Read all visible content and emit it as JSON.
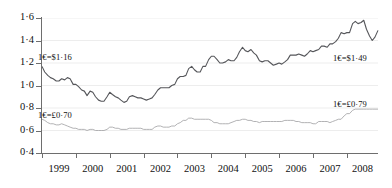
{
  "chart_data": {
    "type": "line",
    "title": "",
    "xlabel": "",
    "ylabel": "",
    "xlim": [
      1999.0,
      2008.92
    ],
    "ylim": [
      0.4,
      1.6
    ],
    "yticks": [
      "0·4",
      "0·6",
      "0·8",
      "1·0",
      "1·2",
      "1·4",
      "1·6"
    ],
    "ytick_values": [
      0.4,
      0.6,
      0.8,
      1.0,
      1.2,
      1.4,
      1.6
    ],
    "xticks": [
      "1999",
      "2000",
      "2001",
      "2002",
      "2003",
      "2004",
      "2005",
      "2006",
      "2007",
      "2008"
    ],
    "xtick_values": [
      1999,
      2000,
      2001,
      2002,
      2003,
      2004,
      2005,
      2006,
      2007,
      2008
    ],
    "grid": true,
    "legend": "none",
    "series": [
      {
        "name": "EUR/USD",
        "color": "#55565a",
        "x": [
          1999.0,
          1999.08,
          1999.17,
          1999.25,
          1999.33,
          1999.42,
          1999.5,
          1999.58,
          1999.67,
          1999.75,
          1999.83,
          1999.92,
          2000.0,
          2000.08,
          2000.17,
          2000.25,
          2000.33,
          2000.42,
          2000.5,
          2000.58,
          2000.67,
          2000.75,
          2000.83,
          2000.92,
          2001.0,
          2001.08,
          2001.17,
          2001.25,
          2001.33,
          2001.42,
          2001.5,
          2001.58,
          2001.67,
          2001.75,
          2001.83,
          2001.92,
          2002.0,
          2002.08,
          2002.17,
          2002.25,
          2002.33,
          2002.42,
          2002.5,
          2002.58,
          2002.67,
          2002.75,
          2002.83,
          2002.92,
          2003.0,
          2003.08,
          2003.17,
          2003.25,
          2003.33,
          2003.42,
          2003.5,
          2003.58,
          2003.67,
          2003.75,
          2003.83,
          2003.92,
          2004.0,
          2004.08,
          2004.17,
          2004.25,
          2004.33,
          2004.42,
          2004.5,
          2004.58,
          2004.67,
          2004.75,
          2004.83,
          2004.92,
          2005.0,
          2005.08,
          2005.17,
          2005.25,
          2005.33,
          2005.42,
          2005.5,
          2005.58,
          2005.67,
          2005.75,
          2005.83,
          2005.92,
          2006.0,
          2006.08,
          2006.17,
          2006.25,
          2006.33,
          2006.42,
          2006.5,
          2006.58,
          2006.67,
          2006.75,
          2006.83,
          2006.92,
          2007.0,
          2007.08,
          2007.17,
          2007.25,
          2007.33,
          2007.42,
          2007.5,
          2007.58,
          2007.67,
          2007.75,
          2007.83,
          2007.92,
          2008.0,
          2008.08,
          2008.17,
          2008.25,
          2008.33,
          2008.42,
          2008.5,
          2008.58,
          2008.67,
          2008.75,
          2008.83,
          2008.92
        ],
        "values": [
          1.17,
          1.12,
          1.09,
          1.07,
          1.06,
          1.04,
          1.04,
          1.06,
          1.05,
          1.07,
          1.06,
          1.01,
          1.01,
          0.99,
          0.96,
          0.95,
          0.91,
          0.95,
          0.94,
          0.9,
          0.87,
          0.86,
          0.86,
          0.9,
          0.94,
          0.92,
          0.9,
          0.89,
          0.87,
          0.85,
          0.86,
          0.9,
          0.91,
          0.9,
          0.89,
          0.89,
          0.88,
          0.87,
          0.88,
          0.89,
          0.92,
          0.96,
          0.98,
          0.98,
          0.98,
          0.98,
          1.0,
          1.01,
          1.06,
          1.08,
          1.08,
          1.09,
          1.15,
          1.17,
          1.14,
          1.12,
          1.12,
          1.17,
          1.17,
          1.23,
          1.26,
          1.26,
          1.23,
          1.2,
          1.2,
          1.21,
          1.23,
          1.22,
          1.22,
          1.25,
          1.3,
          1.34,
          1.31,
          1.3,
          1.32,
          1.29,
          1.27,
          1.22,
          1.21,
          1.22,
          1.22,
          1.2,
          1.18,
          1.19,
          1.2,
          1.19,
          1.21,
          1.23,
          1.27,
          1.27,
          1.27,
          1.28,
          1.27,
          1.26,
          1.28,
          1.31,
          1.3,
          1.31,
          1.32,
          1.35,
          1.35,
          1.34,
          1.37,
          1.37,
          1.39,
          1.42,
          1.47,
          1.46,
          1.47,
          1.47,
          1.55,
          1.57,
          1.55,
          1.56,
          1.58,
          1.5,
          1.44,
          1.4,
          1.43,
          1.49
        ],
        "start_label": "1€=$1·16",
        "end_label": "1€=$1·49"
      },
      {
        "name": "EUR/GBP",
        "color": "#a9a9ac",
        "x": [
          1999.0,
          1999.08,
          1999.17,
          1999.25,
          1999.33,
          1999.42,
          1999.5,
          1999.58,
          1999.67,
          1999.75,
          1999.83,
          1999.92,
          2000.0,
          2000.08,
          2000.17,
          2000.25,
          2000.33,
          2000.42,
          2000.5,
          2000.58,
          2000.67,
          2000.75,
          2000.83,
          2000.92,
          2001.0,
          2001.08,
          2001.17,
          2001.25,
          2001.33,
          2001.42,
          2001.5,
          2001.58,
          2001.67,
          2001.75,
          2001.83,
          2001.92,
          2002.0,
          2002.08,
          2002.17,
          2002.25,
          2002.33,
          2002.42,
          2002.5,
          2002.58,
          2002.67,
          2002.75,
          2002.83,
          2002.92,
          2003.0,
          2003.08,
          2003.17,
          2003.25,
          2003.33,
          2003.42,
          2003.5,
          2003.58,
          2003.67,
          2003.75,
          2003.83,
          2003.92,
          2004.0,
          2004.08,
          2004.17,
          2004.25,
          2004.33,
          2004.42,
          2004.5,
          2004.58,
          2004.67,
          2004.75,
          2004.83,
          2004.92,
          2005.0,
          2005.08,
          2005.17,
          2005.25,
          2005.33,
          2005.42,
          2005.5,
          2005.58,
          2005.67,
          2005.75,
          2005.83,
          2005.92,
          2006.0,
          2006.08,
          2006.17,
          2006.25,
          2006.33,
          2006.42,
          2006.5,
          2006.58,
          2006.67,
          2006.75,
          2006.83,
          2006.92,
          2007.0,
          2007.08,
          2007.17,
          2007.25,
          2007.33,
          2007.42,
          2007.5,
          2007.58,
          2007.67,
          2007.75,
          2007.83,
          2007.92,
          2008.0,
          2008.08,
          2008.17,
          2008.25,
          2008.33,
          2008.42,
          2008.5,
          2008.58,
          2008.67,
          2008.75,
          2008.83,
          2008.92
        ],
        "values": [
          0.7,
          0.69,
          0.67,
          0.66,
          0.66,
          0.65,
          0.65,
          0.66,
          0.65,
          0.64,
          0.63,
          0.62,
          0.62,
          0.61,
          0.61,
          0.61,
          0.6,
          0.61,
          0.61,
          0.6,
          0.6,
          0.6,
          0.6,
          0.61,
          0.63,
          0.63,
          0.62,
          0.62,
          0.61,
          0.61,
          0.61,
          0.62,
          0.62,
          0.62,
          0.62,
          0.62,
          0.61,
          0.61,
          0.61,
          0.61,
          0.63,
          0.64,
          0.64,
          0.63,
          0.63,
          0.63,
          0.64,
          0.64,
          0.66,
          0.67,
          0.69,
          0.69,
          0.71,
          0.71,
          0.7,
          0.7,
          0.7,
          0.7,
          0.7,
          0.7,
          0.69,
          0.67,
          0.67,
          0.66,
          0.66,
          0.66,
          0.66,
          0.67,
          0.68,
          0.69,
          0.69,
          0.7,
          0.7,
          0.69,
          0.69,
          0.68,
          0.68,
          0.67,
          0.68,
          0.68,
          0.68,
          0.68,
          0.68,
          0.68,
          0.68,
          0.68,
          0.69,
          0.69,
          0.69,
          0.69,
          0.68,
          0.68,
          0.67,
          0.67,
          0.67,
          0.67,
          0.66,
          0.66,
          0.68,
          0.68,
          0.68,
          0.68,
          0.67,
          0.68,
          0.69,
          0.7,
          0.7,
          0.73,
          0.75,
          0.75,
          0.78,
          0.79,
          0.79,
          0.79,
          0.79,
          0.79,
          0.79,
          0.79,
          0.79,
          0.79
        ],
        "start_label": "1€=£0·70",
        "end_label": "1€=£0·79"
      }
    ]
  }
}
